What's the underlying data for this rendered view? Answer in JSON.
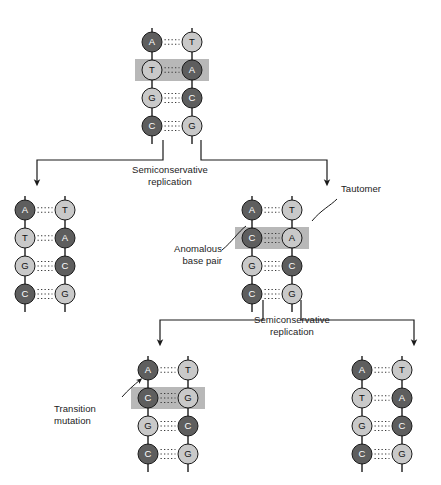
{
  "figure": {
    "title": ""
  },
  "colors": {
    "base_dark": "#5e5e5e",
    "base_light": "#c9c9c9",
    "base_stroke": "#1a1a1a",
    "backbone": "#2b2b2b",
    "highlight": "#b8b8b8",
    "hbond": "#3a3a3a",
    "text": "#1c1c1c",
    "arrow": "#1a1a1a"
  },
  "labels": {
    "replication_1": "Semiconservative\nreplication",
    "replication_2": "Semiconservative\nreplication",
    "tautomer": "Tautomer",
    "anomalous": "Anomalous\nbase pair",
    "transition": "Transition\nmutation"
  },
  "molecules": {
    "parent": {
      "name": "parent-dna",
      "x": 152,
      "y": 20,
      "highlight_row": 1,
      "pairs": [
        {
          "left": "A",
          "left_shade": "dark",
          "right": "T",
          "right_shade": "light",
          "bonds": 2
        },
        {
          "left": "T",
          "left_shade": "light",
          "right": "A",
          "right_shade": "dark",
          "bonds": 2
        },
        {
          "left": "G",
          "left_shade": "light",
          "right": "C",
          "right_shade": "dark",
          "bonds": 3
        },
        {
          "left": "C",
          "left_shade": "dark",
          "right": "G",
          "right_shade": "light",
          "bonds": 3
        }
      ]
    },
    "daughter_left": {
      "name": "daughter-left-dna",
      "x": 25,
      "y": 188,
      "highlight_row": -1,
      "pairs": [
        {
          "left": "A",
          "left_shade": "dark",
          "right": "T",
          "right_shade": "light",
          "bonds": 2
        },
        {
          "left": "T",
          "left_shade": "light",
          "right": "A",
          "right_shade": "dark",
          "bonds": 2
        },
        {
          "left": "G",
          "left_shade": "light",
          "right": "C",
          "right_shade": "dark",
          "bonds": 3
        },
        {
          "left": "C",
          "left_shade": "dark",
          "right": "G",
          "right_shade": "light",
          "bonds": 3
        }
      ]
    },
    "daughter_right": {
      "name": "daughter-right-tautomer-dna",
      "x": 252,
      "y": 188,
      "highlight_row": 1,
      "pairs": [
        {
          "left": "A",
          "left_shade": "dark",
          "right": "T",
          "right_shade": "light",
          "bonds": 2
        },
        {
          "left": "C",
          "left_shade": "dark",
          "right": "A",
          "right_shade": "light",
          "bonds": 3
        },
        {
          "left": "G",
          "left_shade": "light",
          "right": "C",
          "right_shade": "dark",
          "bonds": 3
        },
        {
          "left": "C",
          "left_shade": "dark",
          "right": "G",
          "right_shade": "light",
          "bonds": 3
        }
      ]
    },
    "grand_left": {
      "name": "grandchild-left-mutant-dna",
      "x": 148,
      "y": 348,
      "highlight_row": 1,
      "pairs": [
        {
          "left": "A",
          "left_shade": "dark",
          "right": "T",
          "right_shade": "light",
          "bonds": 2
        },
        {
          "left": "C",
          "left_shade": "dark",
          "right": "G",
          "right_shade": "light",
          "bonds": 3
        },
        {
          "left": "G",
          "left_shade": "light",
          "right": "C",
          "right_shade": "dark",
          "bonds": 3
        },
        {
          "left": "C",
          "left_shade": "dark",
          "right": "G",
          "right_shade": "light",
          "bonds": 3
        }
      ]
    },
    "grand_right": {
      "name": "grandchild-right-normal-dna",
      "x": 362,
      "y": 348,
      "highlight_row": -1,
      "pairs": [
        {
          "left": "A",
          "left_shade": "dark",
          "right": "T",
          "right_shade": "light",
          "bonds": 2
        },
        {
          "left": "T",
          "left_shade": "light",
          "right": "A",
          "right_shade": "dark",
          "bonds": 2
        },
        {
          "left": "G",
          "left_shade": "light",
          "right": "C",
          "right_shade": "dark",
          "bonds": 3
        },
        {
          "left": "C",
          "left_shade": "dark",
          "right": "G",
          "right_shade": "light",
          "bonds": 3
        }
      ]
    }
  },
  "geometry": {
    "strand_gap": 40,
    "row_gap": 28,
    "row_offset": 22,
    "radius": 10,
    "stub_top": 14,
    "stub_bottom": 18
  }
}
